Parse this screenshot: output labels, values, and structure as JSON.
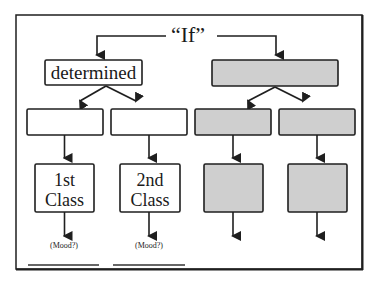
{
  "diagram": {
    "root_label": "“If”",
    "colors": {
      "stroke": "#1f1f1f",
      "white_fill": "#ffffff",
      "gray_fill": "#cfcfcf"
    },
    "left_branch": {
      "top_label": "determined",
      "mid_boxes": [
        "",
        ""
      ],
      "bottom_boxes": [
        {
          "line1": "1st",
          "line2": "Class",
          "note": "(Mood?)"
        },
        {
          "line1": "2nd",
          "line2": "Class",
          "note": "(Mood?)"
        }
      ]
    },
    "right_branch": {
      "top_label": "",
      "mid_boxes": [
        "",
        ""
      ],
      "bottom_boxes": [
        {
          "line1": "",
          "line2": "",
          "note": ""
        },
        {
          "line1": "",
          "line2": "",
          "note": ""
        }
      ]
    }
  }
}
